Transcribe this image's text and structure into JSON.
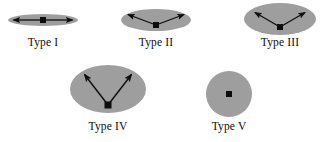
{
  "figure": {
    "caption_labels": [
      "Type I",
      "Type II",
      "Type III",
      "Type IV",
      "Type V"
    ],
    "background_color": "#ffffff",
    "ellipse_fill_color": "#9e9e9e",
    "stroke_color": "#0d0d0d",
    "marker_color": "#0d0d0d"
  },
  "types": {
    "type1": {
      "label": "Type I",
      "shape": "flattened-ellipse",
      "arrow_style": "double-headed-horizontal",
      "arrow_angle_degrees": 0,
      "ellipse_center": [
        43,
        20
      ],
      "ellipse_rx": 35,
      "ellipse_ry": 6,
      "marker_center": [
        43,
        20
      ],
      "arrow_tips": [
        [
          12,
          20
        ],
        [
          74,
          20
        ]
      ]
    },
    "type2": {
      "label": "Type II",
      "shape": "ellipse",
      "arrow_style": "shallow-v-double-headed",
      "arrow_angle_degrees": 18,
      "ellipse_center": [
        156,
        20
      ],
      "ellipse_rx": 35,
      "ellipse_ry": 11,
      "marker_center": [
        156,
        25
      ],
      "arrow_tips": [
        [
          126,
          13
        ],
        [
          187,
          13
        ]
      ]
    },
    "type3": {
      "label": "Type III",
      "shape": "ellipse",
      "arrow_style": "medium-v-double-headed",
      "arrow_angle_degrees": 30,
      "ellipse_center": [
        280,
        19
      ],
      "ellipse_rx": 36,
      "ellipse_ry": 16,
      "marker_center": [
        280,
        27
      ],
      "arrow_tips": [
        [
          252,
          11
        ],
        [
          308,
          11
        ]
      ]
    },
    "type4": {
      "label": "Type IV",
      "shape": "ellipse",
      "arrow_style": "steep-v-double-headed",
      "arrow_angle_degrees": 45,
      "ellipse_center": [
        108,
        89
      ],
      "ellipse_rx": 38,
      "ellipse_ry": 24,
      "marker_center": [
        108,
        105
      ],
      "arrow_tips": [
        [
          82,
          72
        ],
        [
          134,
          72
        ]
      ]
    },
    "type5": {
      "label": "Type V",
      "shape": "circle",
      "arrow_style": "none",
      "arrow_angle_degrees": 90,
      "ellipse_center": [
        229,
        94
      ],
      "ellipse_rx": 23,
      "ellipse_ry": 23,
      "marker_center": [
        229,
        94
      ],
      "arrow_tips": []
    }
  }
}
